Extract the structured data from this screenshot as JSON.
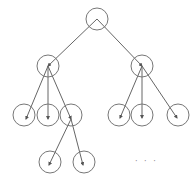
{
  "diagram": {
    "type": "tree",
    "node_color": "#777777",
    "edge_color": "#666666",
    "radius": 11,
    "nodes": [
      {
        "id": "root",
        "cx": 97,
        "cy": 19
      },
      {
        "id": "l1-left",
        "cx": 48,
        "cy": 66
      },
      {
        "id": "l1-right",
        "cx": 142,
        "cy": 66
      },
      {
        "id": "l2-a",
        "cx": 24,
        "cy": 115
      },
      {
        "id": "l2-b",
        "cx": 48,
        "cy": 115
      },
      {
        "id": "l2-c",
        "cx": 71,
        "cy": 115
      },
      {
        "id": "l2-d",
        "cx": 119,
        "cy": 115
      },
      {
        "id": "l2-e",
        "cx": 142,
        "cy": 115
      },
      {
        "id": "l2-f",
        "cx": 178,
        "cy": 115
      },
      {
        "id": "l3-a",
        "cx": 50,
        "cy": 162
      },
      {
        "id": "l3-b",
        "cx": 84,
        "cy": 162
      }
    ],
    "edges": [
      {
        "from": [
          97,
          19
        ],
        "to": [
          48,
          66
        ]
      },
      {
        "from": [
          97,
          19
        ],
        "to": [
          142,
          66
        ]
      },
      {
        "from": [
          48,
          66
        ],
        "to": [
          26,
          119
        ]
      },
      {
        "from": [
          48,
          66
        ],
        "to": [
          48,
          119
        ]
      },
      {
        "from": [
          48,
          66
        ],
        "to": [
          71,
          119
        ]
      },
      {
        "from": [
          142,
          66
        ],
        "to": [
          120,
          118
        ]
      },
      {
        "from": [
          142,
          66
        ],
        "to": [
          142,
          118
        ]
      },
      {
        "from": [
          142,
          66
        ],
        "to": [
          177,
          118
        ]
      },
      {
        "from": [
          71,
          119
        ],
        "to": [
          49,
          165
        ]
      },
      {
        "from": [
          71,
          119
        ],
        "to": [
          83,
          165
        ]
      }
    ],
    "ellipsis": {
      "text": "· · ·",
      "x": 135,
      "y": 164
    }
  }
}
